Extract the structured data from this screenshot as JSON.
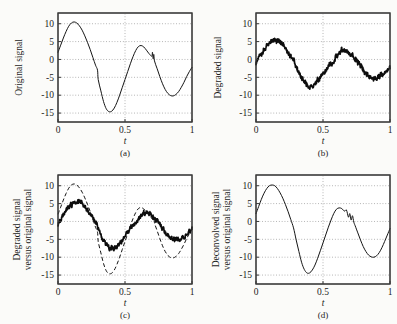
{
  "figure": {
    "background_color": "#fbfbf9",
    "line_color": "#151515",
    "grid_color": "#8d8d8d",
    "axis_color": "#3a3a3a"
  },
  "chart_data": [
    {
      "type": "line",
      "panel": "a",
      "caption": "(a)",
      "title": "",
      "xlabel": "t",
      "ylabel": "Original signal",
      "xlim": [
        0,
        1
      ],
      "ylim": [
        -17.5,
        13
      ],
      "xticks": [
        0,
        0.5,
        1
      ],
      "xticklabels": [
        "0",
        "0.5",
        "1"
      ],
      "yticks": [
        10,
        5,
        0,
        -5,
        -10,
        -15
      ],
      "yticklabels": [
        "10",
        "5",
        "0",
        "-5",
        "-10",
        "-15"
      ],
      "grid": true,
      "legend": "none",
      "series": [
        {
          "name": "Original signal",
          "style": "solid",
          "x": [
            0.0,
            0.02,
            0.04,
            0.06,
            0.08,
            0.1,
            0.12,
            0.14,
            0.16,
            0.18,
            0.2,
            0.22,
            0.24,
            0.26,
            0.28,
            0.295,
            0.3,
            0.32,
            0.34,
            0.36,
            0.38,
            0.4,
            0.42,
            0.44,
            0.46,
            0.48,
            0.5,
            0.52,
            0.54,
            0.56,
            0.58,
            0.6,
            0.62,
            0.64,
            0.66,
            0.68,
            0.7,
            0.705,
            0.71,
            0.715,
            0.72,
            0.74,
            0.76,
            0.78,
            0.8,
            0.82,
            0.84,
            0.86,
            0.88,
            0.9,
            0.92,
            0.94,
            0.96,
            0.98,
            1.0
          ],
          "y": [
            2.0,
            4.0,
            6.0,
            7.8,
            9.3,
            10.2,
            10.5,
            10.2,
            9.4,
            8.2,
            6.6,
            4.8,
            2.8,
            0.6,
            -1.6,
            -3.0,
            -5.6,
            -8.8,
            -11.8,
            -13.8,
            -14.6,
            -14.5,
            -13.6,
            -12.0,
            -10.0,
            -7.8,
            -5.6,
            -3.4,
            -1.2,
            0.8,
            2.5,
            3.6,
            3.9,
            3.5,
            2.6,
            1.6,
            0.9,
            2.0,
            0.2,
            1.4,
            -0.4,
            -2.6,
            -4.8,
            -6.8,
            -8.4,
            -9.5,
            -10.1,
            -10.2,
            -9.8,
            -9.0,
            -7.8,
            -6.4,
            -4.8,
            -3.4,
            -2.2
          ]
        }
      ]
    },
    {
      "type": "line",
      "panel": "b",
      "caption": "(b)",
      "title": "",
      "xlabel": "t",
      "ylabel": "Degraded signal",
      "xlim": [
        0,
        1
      ],
      "ylim": [
        -17.5,
        13
      ],
      "xticks": [
        0,
        0.5,
        1
      ],
      "xticklabels": [
        "0",
        "0.5",
        "1"
      ],
      "yticks": [
        10,
        5,
        0,
        -5,
        -10,
        -15
      ],
      "yticklabels": [
        "10",
        "5",
        "0",
        "-5",
        "-10",
        "-15"
      ],
      "grid": true,
      "legend": "none",
      "series": [
        {
          "name": "Degraded signal",
          "style": "solid-noisy",
          "noise_amplitude": 0.45,
          "x": [
            0.0,
            0.02,
            0.04,
            0.06,
            0.08,
            0.1,
            0.12,
            0.14,
            0.16,
            0.18,
            0.2,
            0.22,
            0.24,
            0.26,
            0.28,
            0.3,
            0.32,
            0.34,
            0.36,
            0.38,
            0.4,
            0.42,
            0.44,
            0.46,
            0.48,
            0.5,
            0.52,
            0.54,
            0.56,
            0.58,
            0.6,
            0.62,
            0.64,
            0.66,
            0.68,
            0.7,
            0.72,
            0.74,
            0.76,
            0.78,
            0.8,
            0.82,
            0.84,
            0.86,
            0.88,
            0.9,
            0.92,
            0.94,
            0.96,
            0.98,
            1.0
          ],
          "y": [
            -1.0,
            0.4,
            1.8,
            3.0,
            4.0,
            4.7,
            5.2,
            5.4,
            5.3,
            4.9,
            4.2,
            3.3,
            2.2,
            1.0,
            -0.4,
            -2.0,
            -3.8,
            -5.4,
            -6.6,
            -7.4,
            -7.7,
            -7.6,
            -7.0,
            -6.2,
            -5.2,
            -4.2,
            -3.2,
            -2.2,
            -1.2,
            -0.2,
            0.8,
            1.7,
            2.3,
            2.5,
            2.3,
            1.7,
            1.0,
            0.2,
            -0.8,
            -1.9,
            -3.0,
            -3.9,
            -4.6,
            -5.0,
            -5.2,
            -5.1,
            -4.8,
            -4.3,
            -3.6,
            -2.9,
            -2.2
          ]
        }
      ]
    },
    {
      "type": "line",
      "panel": "c",
      "caption": "(c)",
      "title": "",
      "xlabel": "t",
      "ylabel": "Degraded signal versus original signal",
      "xlim": [
        0,
        1
      ],
      "ylim": [
        -17.5,
        13
      ],
      "xticks": [
        0,
        0.5,
        1
      ],
      "xticklabels": [
        "0",
        "0.5",
        "1"
      ],
      "yticks": [
        10,
        5,
        0,
        -5,
        -10,
        -15
      ],
      "yticklabels": [
        "10",
        "5",
        "0",
        "-5",
        "-10",
        "-15"
      ],
      "grid": true,
      "legend": "none",
      "series": [
        {
          "name": "Original signal",
          "style": "dashed",
          "x": [
            0.0,
            0.02,
            0.04,
            0.06,
            0.08,
            0.1,
            0.12,
            0.14,
            0.16,
            0.18,
            0.2,
            0.22,
            0.24,
            0.26,
            0.28,
            0.295,
            0.3,
            0.32,
            0.34,
            0.36,
            0.38,
            0.4,
            0.42,
            0.44,
            0.46,
            0.48,
            0.5,
            0.52,
            0.54,
            0.56,
            0.58,
            0.6,
            0.62,
            0.64,
            0.66,
            0.68,
            0.7,
            0.705,
            0.71,
            0.715,
            0.72,
            0.74,
            0.76,
            0.78,
            0.8,
            0.82,
            0.84,
            0.86,
            0.88,
            0.9,
            0.92,
            0.94,
            0.96,
            0.98,
            1.0
          ],
          "y": [
            2.0,
            4.0,
            6.0,
            7.8,
            9.3,
            10.2,
            10.5,
            10.2,
            9.4,
            8.2,
            6.6,
            4.8,
            2.8,
            0.6,
            -1.6,
            -3.0,
            -5.6,
            -8.8,
            -11.8,
            -13.8,
            -14.6,
            -14.5,
            -13.6,
            -12.0,
            -10.0,
            -7.8,
            -5.6,
            -3.4,
            -1.2,
            0.8,
            2.5,
            3.6,
            3.9,
            3.5,
            2.6,
            1.6,
            0.9,
            2.0,
            0.2,
            1.4,
            -0.4,
            -2.6,
            -4.8,
            -6.8,
            -8.4,
            -9.5,
            -10.1,
            -10.2,
            -9.8,
            -9.0,
            -7.8,
            -6.4,
            -4.8,
            -3.4,
            -2.2
          ]
        },
        {
          "name": "Degraded signal",
          "style": "solid-noisy",
          "noise_amplitude": 0.45,
          "x": [
            0.0,
            0.02,
            0.04,
            0.06,
            0.08,
            0.1,
            0.12,
            0.14,
            0.16,
            0.18,
            0.2,
            0.22,
            0.24,
            0.26,
            0.28,
            0.3,
            0.32,
            0.34,
            0.36,
            0.38,
            0.4,
            0.42,
            0.44,
            0.46,
            0.48,
            0.5,
            0.52,
            0.54,
            0.56,
            0.58,
            0.6,
            0.62,
            0.64,
            0.66,
            0.68,
            0.7,
            0.72,
            0.74,
            0.76,
            0.78,
            0.8,
            0.82,
            0.84,
            0.86,
            0.88,
            0.9,
            0.92,
            0.94,
            0.96,
            0.98,
            1.0
          ],
          "y": [
            -1.0,
            0.4,
            1.8,
            3.0,
            4.0,
            4.7,
            5.2,
            5.4,
            5.3,
            4.9,
            4.2,
            3.3,
            2.2,
            1.0,
            -0.4,
            -2.0,
            -3.8,
            -5.4,
            -6.6,
            -7.4,
            -7.7,
            -7.6,
            -7.0,
            -6.2,
            -5.2,
            -4.2,
            -3.2,
            -2.2,
            -1.2,
            -0.2,
            0.8,
            1.7,
            2.3,
            2.5,
            2.3,
            1.7,
            1.0,
            0.2,
            -0.8,
            -1.9,
            -3.0,
            -3.9,
            -4.6,
            -5.0,
            -5.2,
            -5.1,
            -4.8,
            -4.3,
            -3.6,
            -2.9,
            -2.2
          ]
        }
      ]
    },
    {
      "type": "line",
      "panel": "d",
      "caption": "(d)",
      "title": "",
      "xlabel": "t",
      "ylabel": "Deconvolved signal versus original signal",
      "xlim": [
        0,
        1
      ],
      "ylim": [
        -17.5,
        13
      ],
      "xticks": [
        0,
        0.5,
        1
      ],
      "xticklabels": [
        "0",
        "0.5",
        "1"
      ],
      "yticks": [
        10,
        5,
        0,
        -5,
        -10,
        -15
      ],
      "yticklabels": [
        "10",
        "5",
        "0",
        "-5",
        "-10",
        "-15"
      ],
      "grid": true,
      "legend": "none",
      "series": [
        {
          "name": "Deconvolved signal",
          "style": "solid",
          "x": [
            0.0,
            0.02,
            0.04,
            0.06,
            0.08,
            0.1,
            0.12,
            0.14,
            0.16,
            0.18,
            0.2,
            0.22,
            0.24,
            0.26,
            0.28,
            0.3,
            0.32,
            0.34,
            0.36,
            0.38,
            0.4,
            0.42,
            0.44,
            0.46,
            0.48,
            0.5,
            0.52,
            0.54,
            0.56,
            0.58,
            0.6,
            0.62,
            0.64,
            0.66,
            0.675,
            0.69,
            0.7,
            0.71,
            0.72,
            0.73,
            0.74,
            0.76,
            0.78,
            0.8,
            0.82,
            0.84,
            0.86,
            0.88,
            0.9,
            0.92,
            0.94,
            0.96,
            0.98,
            1.0
          ],
          "y": [
            2.2,
            4.2,
            6.2,
            7.9,
            9.2,
            10.0,
            10.2,
            10.0,
            9.2,
            8.0,
            6.5,
            4.7,
            2.7,
            0.5,
            -1.8,
            -5.2,
            -8.4,
            -11.4,
            -13.4,
            -14.4,
            -14.4,
            -13.6,
            -12.2,
            -10.3,
            -8.2,
            -6.0,
            -3.8,
            -1.6,
            0.4,
            2.2,
            3.4,
            3.8,
            3.6,
            2.9,
            3.2,
            1.2,
            2.2,
            0.4,
            1.6,
            -0.2,
            -1.2,
            -3.2,
            -5.2,
            -7.0,
            -8.4,
            -9.4,
            -9.9,
            -10.0,
            -9.6,
            -8.7,
            -7.3,
            -5.6,
            -3.8,
            -2.0
          ]
        }
      ]
    }
  ]
}
